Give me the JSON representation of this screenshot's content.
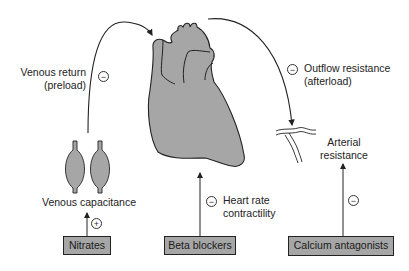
{
  "colors": {
    "organ_fill": "#a6a6a6",
    "box_fill": "#a6a6a6",
    "line": "#222222",
    "background": "#ffffff"
  },
  "labels": {
    "venous_return": [
      "Venous return",
      "(preload)"
    ],
    "outflow_resistance": [
      "Outflow resistance",
      "(afterload)"
    ],
    "venous_capacitance": "Venous capacitance",
    "arterial_resistance": [
      "Arterial",
      "resistance"
    ],
    "heart_rate": [
      "Heart rate",
      "contractility"
    ]
  },
  "drugs": [
    {
      "name": "Nitrates",
      "effect_sign": "+",
      "target": "Venous capacitance"
    },
    {
      "name": "Beta blockers",
      "effect_sign": "−",
      "target": "Heart rate contractility"
    },
    {
      "name": "Calcium antagonists",
      "effect_sign": "−",
      "target": "Arterial resistance"
    }
  ],
  "signs": {
    "venous_return": "−",
    "outflow_resistance": "−",
    "heart_rate": "−",
    "arterial_resistance": "−",
    "venous_capacitance": "+"
  },
  "icons": [
    "heart-icon",
    "vein-icon",
    "artery-icon",
    "arrow-icon"
  ]
}
